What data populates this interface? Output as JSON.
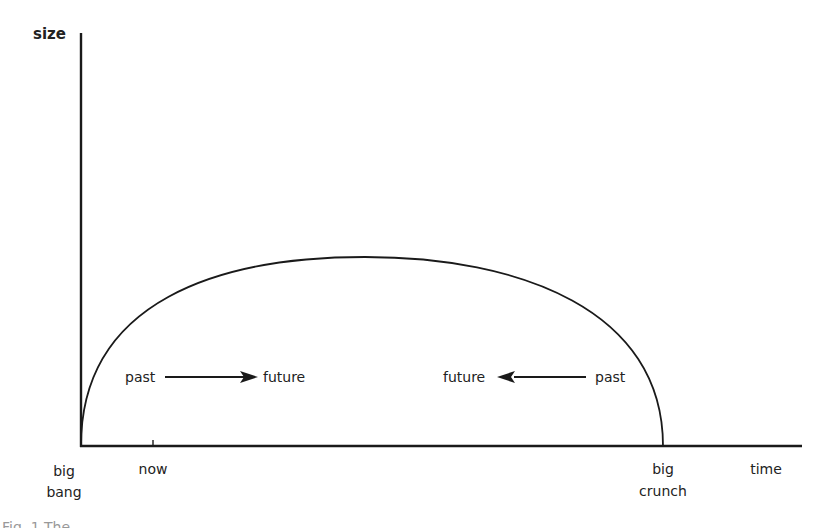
{
  "diagram": {
    "type": "closed-universe-timeline",
    "axes": {
      "y_label": "size",
      "x_label": "time"
    },
    "markers": {
      "origin_label_line1": "big",
      "origin_label_line2": "bang",
      "now_label": "now",
      "end_label_line1": "big",
      "end_label_line2": "crunch"
    },
    "annotations": {
      "left": {
        "from": "past",
        "to": "future",
        "direction": "right"
      },
      "right": {
        "from": "past",
        "to": "future",
        "direction": "left"
      }
    },
    "curve": {
      "description": "semi-elliptical expansion then contraction",
      "start_x": 81,
      "peak_x": 365,
      "peak_y": 257,
      "end_x": 663,
      "baseline_y": 446
    },
    "colors": {
      "ink": "#1a1a1a",
      "background": "#ffffff"
    }
  },
  "caption": {
    "text": "Fig. 1 The ..."
  }
}
